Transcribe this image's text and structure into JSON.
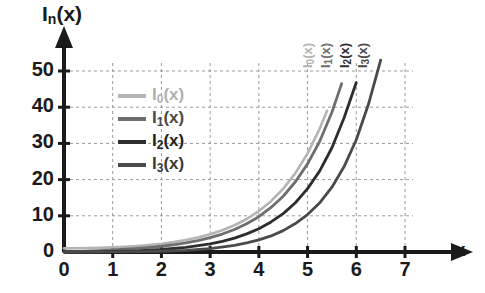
{
  "chart_data": {
    "type": "line",
    "title": "",
    "xlabel": "x",
    "ylabel": "I_n(x)",
    "ylabel_base": "I",
    "ylabel_sub": "n",
    "ylabel_arg": "(x)",
    "xlim": [
      0,
      7
    ],
    "ylim": [
      0,
      55
    ],
    "xticks": [
      0,
      1,
      2,
      3,
      4,
      5,
      6,
      7
    ],
    "yticks": [
      0,
      10,
      20,
      30,
      40,
      50
    ],
    "grid": true,
    "grid_style": "dashed",
    "legend_position": "inside-left",
    "series": [
      {
        "name": "I_0(x)",
        "label_base": "I",
        "label_sub": "0",
        "label_arg": "(x)",
        "color": "#b4b4b4",
        "x": [
          0,
          0.25,
          0.5,
          0.75,
          1,
          1.25,
          1.5,
          1.75,
          2,
          2.25,
          2.5,
          2.75,
          3,
          3.25,
          3.5,
          3.75,
          4,
          4.25,
          4.5,
          4.75,
          5,
          5.25,
          5.4
        ],
        "values": [
          1.0,
          1.016,
          1.063,
          1.146,
          1.266,
          1.428,
          1.647,
          1.933,
          2.28,
          2.73,
          3.29,
          4.0,
          4.88,
          6.0,
          7.38,
          9.12,
          11.3,
          14.05,
          17.48,
          21.8,
          27.24,
          34.1,
          39.0
        ]
      },
      {
        "name": "I_1(x)",
        "label_base": "I",
        "label_sub": "1",
        "label_arg": "(x)",
        "color": "#6e6e6e",
        "x": [
          0,
          0.25,
          0.5,
          0.75,
          1,
          1.25,
          1.5,
          1.75,
          2,
          2.25,
          2.5,
          2.75,
          3,
          3.25,
          3.5,
          3.75,
          4,
          4.25,
          4.5,
          4.75,
          5,
          5.25,
          5.5,
          5.7
        ],
        "values": [
          0.0,
          0.126,
          0.258,
          0.402,
          0.565,
          0.757,
          0.982,
          1.26,
          1.59,
          2.0,
          2.52,
          3.16,
          3.95,
          4.96,
          6.21,
          7.8,
          9.76,
          12.3,
          15.4,
          19.4,
          24.34,
          30.6,
          38.6,
          46.5
        ]
      },
      {
        "name": "I_2(x)",
        "label_base": "I",
        "label_sub": "2",
        "label_arg": "(x)",
        "color": "#2e2e2e",
        "x": [
          0,
          0.5,
          1,
          1.5,
          2,
          2.5,
          3,
          3.25,
          3.5,
          3.75,
          4,
          4.25,
          4.5,
          4.75,
          5,
          5.25,
          5.5,
          5.75,
          6.0
        ],
        "values": [
          0.0,
          0.032,
          0.136,
          0.338,
          0.689,
          1.276,
          2.245,
          2.93,
          3.83,
          5.01,
          6.42,
          8.3,
          10.6,
          13.6,
          17.5,
          22.4,
          28.8,
          37.1,
          46.8
        ]
      },
      {
        "name": "I_3(x)",
        "label_base": "I",
        "label_sub": "3",
        "label_arg": "(x)",
        "color": "#4a4a4a",
        "x": [
          0,
          0.5,
          1,
          1.5,
          2,
          2.5,
          3,
          3.5,
          3.75,
          4,
          4.25,
          4.5,
          4.75,
          5,
          5.25,
          5.5,
          5.75,
          6,
          6.25,
          6.5
        ],
        "values": [
          0.0,
          0.0026,
          0.0222,
          0.0807,
          0.2127,
          0.4739,
          0.9598,
          1.834,
          2.5,
          3.34,
          4.44,
          5.9,
          7.85,
          10.33,
          13.6,
          17.9,
          23.6,
          31.0,
          40.8,
          53.0
        ]
      }
    ],
    "curve_tags": [
      {
        "label_base": "I",
        "label_sub": "0",
        "label_arg": "(x)",
        "color": "#b4b4b4"
      },
      {
        "label_base": "I",
        "label_sub": "1",
        "label_arg": "(x)",
        "color": "#6e6e6e"
      },
      {
        "label_base": "I",
        "label_sub": "2",
        "label_arg": "(x)",
        "color": "#2e2e2e"
      },
      {
        "label_base": "I",
        "label_sub": "3",
        "label_arg": "(x)",
        "color": "#4a4a4a"
      }
    ],
    "axis_color": "#1a1a1a",
    "grid_color": "#9a9a9a",
    "background": "#ffffff"
  }
}
